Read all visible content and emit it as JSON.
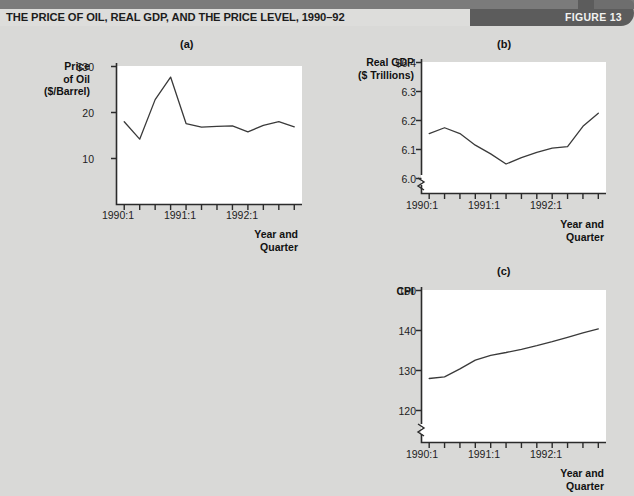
{
  "header": {
    "title": "THE PRICE OF OIL, REAL GDP, AND THE PRICE LEVEL, 1990–92",
    "figure_label": "FIGURE 13",
    "band_color": "#5c5c5c",
    "background_color": "#d9d9d7"
  },
  "panels": {
    "a": {
      "letter": "(a)",
      "y_axis_title": "Price\nof Oil\n($/Barrel)",
      "y_axis_title_lines": [
        "Price",
        "of Oil",
        "($/Barrel)"
      ],
      "x_axis_title_lines": [
        "Year and",
        "Quarter"
      ],
      "y_ticks": [
        "$30",
        "20",
        "10"
      ],
      "x_ticks": [
        "1990:1",
        "1991:1",
        "1992:1"
      ]
    },
    "b": {
      "letter": "(b)",
      "y_axis_title_lines": [
        "Real GDP",
        "($ Trillions)"
      ],
      "x_axis_title_lines": [
        "Year and",
        "Quarter"
      ],
      "y_ticks": [
        "$6.4",
        "6.3",
        "6.2",
        "6.1",
        "6.0"
      ],
      "x_ticks": [
        "1990:1",
        "1991:1",
        "1992:1"
      ],
      "axis_break": true
    },
    "c": {
      "letter": "(c)",
      "y_axis_title_lines": [
        "CPI"
      ],
      "x_axis_title_lines": [
        "Year and",
        "Quarter"
      ],
      "y_ticks": [
        "150",
        "140",
        "130",
        "120"
      ],
      "x_ticks": [
        "1990:1",
        "1991:1",
        "1992:1"
      ],
      "axis_break": true
    }
  },
  "chart_data": [
    {
      "id": "a",
      "type": "line",
      "title": "(a)",
      "ylabel": "Price of Oil ($/Barrel)",
      "xlabel": "Year and Quarter",
      "ylim": [
        0,
        32
      ],
      "yticks": [
        10,
        20,
        30
      ],
      "ytick_labels": [
        "10",
        "20",
        "$30"
      ],
      "grid": false,
      "legend": "none",
      "axis_break": false,
      "categories": [
        "1990:1",
        "1990:2",
        "1990:3",
        "1990:4",
        "1991:1",
        "1991:2",
        "1991:3",
        "1991:4",
        "1992:1",
        "1992:2",
        "1992:3",
        "1992:4"
      ],
      "xtick_labels_shown": [
        "1990:1",
        "1991:1",
        "1992:1"
      ],
      "values": [
        18.0,
        14.2,
        22.8,
        27.7,
        17.6,
        16.8,
        17.0,
        17.1,
        15.8,
        17.2,
        18.0,
        16.9
      ]
    },
    {
      "id": "b",
      "type": "line",
      "title": "(b)",
      "ylabel": "Real GDP ($ Trillions)",
      "xlabel": "Year and Quarter",
      "ylim": [
        5.95,
        6.45
      ],
      "yticks": [
        6.0,
        6.1,
        6.2,
        6.3,
        6.4
      ],
      "ytick_labels": [
        "6.0",
        "6.1",
        "6.2",
        "6.3",
        "$6.4"
      ],
      "grid": false,
      "legend": "none",
      "axis_break": true,
      "categories": [
        "1990:1",
        "1990:2",
        "1990:3",
        "1990:4",
        "1991:1",
        "1991:2",
        "1991:3",
        "1991:4",
        "1992:1",
        "1992:2",
        "1992:3",
        "1992:4"
      ],
      "xtick_labels_shown": [
        "1990:1",
        "1991:1",
        "1992:1"
      ],
      "values": [
        6.155,
        6.175,
        6.155,
        6.115,
        6.085,
        6.05,
        6.072,
        6.09,
        6.105,
        6.11,
        6.18,
        6.225
      ]
    },
    {
      "id": "c",
      "type": "line",
      "title": "(c)",
      "ylabel": "CPI",
      "xlabel": "Year and Quarter",
      "ylim": [
        117,
        152
      ],
      "yticks": [
        120,
        130,
        140,
        150
      ],
      "ytick_labels": [
        "120",
        "130",
        "140",
        "150"
      ],
      "grid": false,
      "legend": "none",
      "axis_break": true,
      "categories": [
        "1990:1",
        "1990:2",
        "1990:3",
        "1990:4",
        "1991:1",
        "1991:2",
        "1991:3",
        "1991:4",
        "1992:1",
        "1992:2",
        "1992:3",
        "1992:4"
      ],
      "xtick_labels_shown": [
        "1990:1",
        "1991:1",
        "1992:1"
      ],
      "values": [
        128.0,
        128.4,
        130.4,
        132.6,
        133.8,
        134.5,
        135.3,
        136.2,
        137.2,
        138.3,
        139.4,
        140.4
      ]
    }
  ]
}
